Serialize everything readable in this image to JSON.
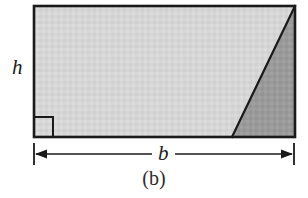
{
  "figure": {
    "caption": "(b)",
    "background_color": "#ffffff",
    "stroke_color": "#1a1a1a",
    "labels": {
      "height": "h",
      "base": "b"
    },
    "shapes": {
      "rectangle": {
        "name": "outer-rectangle",
        "x": 34,
        "y": 6,
        "width": 261,
        "height": 131,
        "fill_color": "#d6d6d6",
        "stroke_color": "#1a1a1a",
        "stroke_width": 2.4
      },
      "dark_triangle": {
        "name": "shaded-triangle",
        "points": "232,137 295,6 295,137",
        "fill_color": "#9a9a9a",
        "stroke_color": "#1a1a1a",
        "stroke_width": 2.2
      },
      "diagonal": {
        "name": "diagonal-edge",
        "x1": 295,
        "y1": 6,
        "x2": 232,
        "y2": 137
      },
      "right_angle_marker": {
        "name": "right-angle-marker",
        "x": 34,
        "y": 117,
        "size": 19,
        "stroke_color": "#1a1a1a",
        "stroke_width": 2.0
      }
    },
    "dimension_line": {
      "name": "base-dimension",
      "y": 154,
      "x_start": 34,
      "x_end": 294,
      "tick_half_height": 11,
      "arrow_length": 9,
      "arrow_half_width": 4
    }
  }
}
